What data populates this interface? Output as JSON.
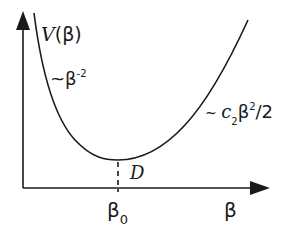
{
  "diagram": {
    "type": "potential-curve",
    "axes": {
      "y_label_func": "V",
      "y_label_open": "(",
      "y_label_var": "β",
      "y_label_close": ")",
      "x_label": "β"
    },
    "annotations": {
      "left_asymptote": {
        "prefix": "~β",
        "exponent": "-2"
      },
      "right_asymptote": {
        "prefix": "~ ",
        "coef": "c",
        "coef_sub": "2",
        "var": "β",
        "exponent": "2",
        "suffix": "/2"
      },
      "minimum_depth": "D",
      "minimum_position": {
        "base": "β",
        "sub": "0"
      }
    },
    "colors": {
      "stroke": "#1a1a1a",
      "background": "#ffffff"
    }
  }
}
